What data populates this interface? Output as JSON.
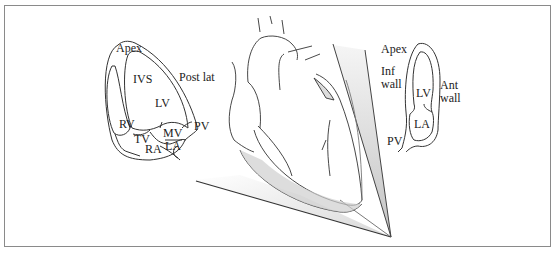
{
  "figure": {
    "left_view": {
      "name": "apical four-chamber view",
      "labels": {
        "apex": "Apex",
        "ivs": "IVS",
        "post_lat": "Post lat",
        "lv": "LV",
        "rv": "RV",
        "tv": "TV",
        "ra": "RA",
        "mv": "MV",
        "la": "LA",
        "pv": "PV"
      }
    },
    "center_view": {
      "name": "heart with ultrasound beam from apex"
    },
    "right_view": {
      "name": "apical two-chamber view",
      "labels": {
        "apex": "Apex",
        "inf_wall_1": "Inf",
        "inf_wall_2": "wall",
        "ant_wall_1": "Ant",
        "ant_wall_2": "wall",
        "lv": "LV",
        "la": "LA",
        "pv": "PV"
      }
    },
    "colors": {
      "line": "#333333",
      "frame": "#8a8a8a",
      "shade": "#d8d8d8"
    }
  }
}
